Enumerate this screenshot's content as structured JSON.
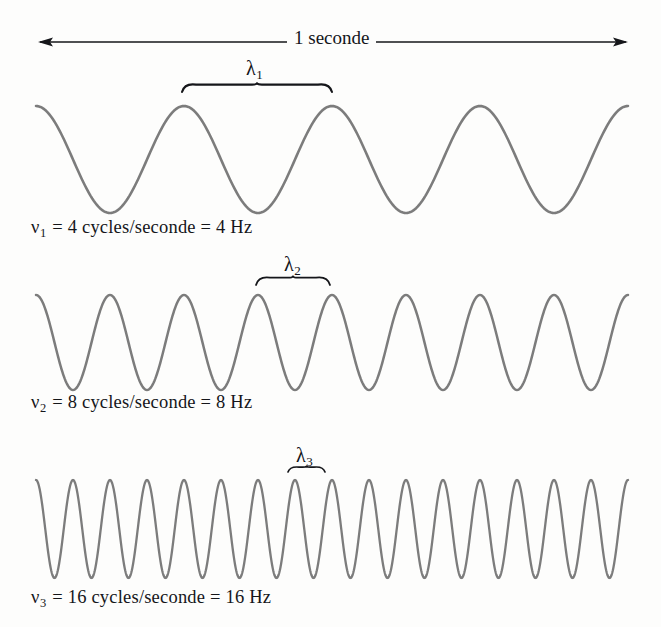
{
  "figure": {
    "title_arrow": {
      "label": "1 seconde",
      "arrow_left_x": 38,
      "arrow_right_x": 628,
      "arrow_y": 42,
      "double_headed": true
    },
    "background_color": "#fdfdfc",
    "wave_color": "#7c7c7c",
    "ink_color": "#15161a",
    "span_start_x": 36,
    "span_end_x": 628
  },
  "waves": [
    {
      "id": "wave-1",
      "cycles": 4,
      "label": "ν₁ = 4 cycles/seconde = 4 Hz",
      "symbol": "ν",
      "symbol_sub": "1",
      "value_cycles": "4",
      "unit_cycles": "cycles/seconde",
      "value_hz": "4",
      "unit_hz": "Hz",
      "lambda_symbol": "λ",
      "lambda_sub": "1",
      "lambda_label": "λ₁",
      "crest_y": 106,
      "trough_y": 213,
      "center_y": 159.5,
      "amplitude": 53.5,
      "brace_start_x": 182,
      "brace_end_x": 332,
      "brace_y": 92
    },
    {
      "id": "wave-2",
      "cycles": 8,
      "label": "ν₂ = 8 cycles/seconde = 8 Hz",
      "symbol": "ν",
      "symbol_sub": "2",
      "value_cycles": "8",
      "unit_cycles": "cycles/seconde",
      "value_hz": "8",
      "unit_hz": "Hz",
      "lambda_symbol": "λ",
      "lambda_sub": "2",
      "lambda_label": "λ₂",
      "crest_y": 295,
      "trough_y": 390,
      "center_y": 342.5,
      "amplitude": 47.5,
      "brace_start_x": 256,
      "brace_end_x": 330,
      "brace_y": 285
    },
    {
      "id": "wave-3",
      "cycles": 16,
      "label": "ν₃ = 16 cycles/seconde = 16 Hz",
      "symbol": "ν",
      "symbol_sub": "3",
      "value_cycles": "16",
      "unit_cycles": "cycles/seconde",
      "value_hz": "16",
      "unit_hz": "Hz",
      "lambda_symbol": "λ",
      "lambda_sub": "3",
      "lambda_label": "λ₃",
      "crest_y": 480,
      "trough_y": 578,
      "center_y": 529,
      "amplitude": 49,
      "brace_start_x": 288,
      "brace_end_x": 325,
      "brace_y": 472
    }
  ],
  "chart_data": {
    "type": "line",
    "title": "1 seconde",
    "xlabel": "",
    "ylabel": "",
    "x_span_seconds": 1,
    "grid": false,
    "legend": "none",
    "series": [
      {
        "name": "ν₁ = 4 cycles/seconde = 4 Hz",
        "frequency_hz": 4,
        "wavelength_label": "λ₁",
        "waveform": "cosine",
        "cycles_in_one_second": 4
      },
      {
        "name": "ν₂ = 8 cycles/seconde = 8 Hz",
        "frequency_hz": 8,
        "wavelength_label": "λ₂",
        "waveform": "cosine",
        "cycles_in_one_second": 8
      },
      {
        "name": "ν₃ = 16 cycles/seconde = 16 Hz",
        "frequency_hz": 16,
        "wavelength_label": "λ₃",
        "waveform": "cosine",
        "cycles_in_one_second": 16
      }
    ]
  }
}
